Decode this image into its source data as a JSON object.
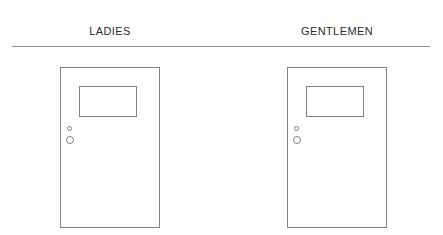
{
  "diagram": {
    "background_color": "#ffffff",
    "line_color": "#7d8285",
    "divider_color": "#8e9194",
    "text_color": "#2b2b2b",
    "labels": [
      {
        "id": "ladies",
        "text": "LADIES"
      },
      {
        "id": "gentlemen",
        "text": "GENTLEMEN"
      }
    ],
    "doors": [
      {
        "id": "ladies",
        "label": "LADIES",
        "window": {
          "name": "door-window"
        },
        "peephole": {
          "name": "door-peephole"
        },
        "lock": {
          "name": "door-lock"
        }
      },
      {
        "id": "gentlemen",
        "label": "GENTLEMEN",
        "window": {
          "name": "door-window"
        },
        "peephole": {
          "name": "door-peephole"
        },
        "lock": {
          "name": "door-lock"
        }
      }
    ]
  }
}
